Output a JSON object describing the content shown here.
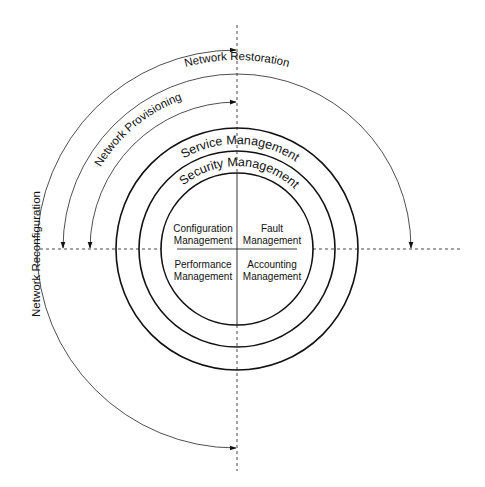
{
  "diagram": {
    "center": {
      "x": 237,
      "y": 249
    },
    "rings": [
      {
        "name": "service-management-ring",
        "radius": 121,
        "label": "Service Management",
        "label_radius": 105
      },
      {
        "name": "security-management-ring",
        "radius": 98,
        "label": "Security Management",
        "label_radius": 83
      },
      {
        "name": "core-ring",
        "radius": 76
      }
    ],
    "quadrants": {
      "top_left": {
        "line1": "Configuration",
        "line2": "Management"
      },
      "top_right": {
        "line1": "Fault",
        "line2": "Management"
      },
      "bottom_left": {
        "line1": "Performance",
        "line2": "Management"
      },
      "bottom_right": {
        "line1": "Accounting",
        "line2": "Management"
      }
    },
    "cycles": [
      {
        "name": "network-restoration",
        "label": "Network Restoration",
        "radius": 174,
        "from": "left",
        "to": "right",
        "arrows": "both"
      },
      {
        "name": "network-provisioning",
        "label": "Network Provisioning",
        "radius": 147,
        "from": "left",
        "to": "top",
        "arrows": "both"
      },
      {
        "name": "network-reconfiguration",
        "label": "Network Reconfiguration",
        "radius": 199,
        "from": "top",
        "to": "bottom",
        "arrows": "both"
      }
    ],
    "labels": {
      "restoration": "Network Restoration",
      "provisioning": "Network Provisioning",
      "reconfiguration": "Network Reconfiguration",
      "service": "Service Management",
      "security": "Security Management"
    },
    "colors": {
      "line": "#111111",
      "background": "#ffffff"
    }
  }
}
